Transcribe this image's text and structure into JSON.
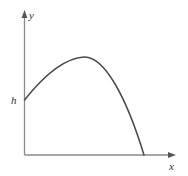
{
  "figure": {
    "background_color": "#ffffff",
    "width": 188,
    "height": 176,
    "axis_color": "#8a8a8a",
    "curve_color": "#4a4a4a",
    "label_color": "#333333",
    "axis_stroke_width": 1.3,
    "curve_stroke_width": 1.5
  },
  "axes": {
    "y_axis": {
      "label": "y",
      "label_x": 29,
      "label_y": 19,
      "x": 24.5,
      "top": 12,
      "bottom": 155,
      "arrow": "up"
    },
    "x_axis": {
      "label": "x",
      "label_x": 169,
      "label_y": 170,
      "y": 155,
      "left": 24.5,
      "right": 175,
      "arrow": "right"
    }
  },
  "markers": {
    "initial_height": {
      "label": "h",
      "label_x": 11,
      "label_y": 104,
      "axis_x": 24.5,
      "axis_y": 100
    }
  },
  "chart_data": {
    "type": "line",
    "title": "",
    "xlabel": "x",
    "ylabel": "y",
    "grid": false,
    "legend": false,
    "xlim": [
      0,
      175
    ],
    "ylim": [
      0,
      155
    ],
    "annotations": [
      {
        "text": "h",
        "meaning": "initial height on y-axis",
        "x": 0,
        "y": 55
      },
      {
        "text": "y",
        "meaning": "vertical axis label"
      },
      {
        "text": "x",
        "meaning": "horizontal axis label"
      }
    ],
    "series": [
      {
        "name": "trajectory",
        "description": "downward-opening parabolic arc launched from height h, peaking then falling to the x-axis",
        "color": "#4a4a4a",
        "points": [
          {
            "x": 24.5,
            "y": 100
          },
          {
            "x": 33,
            "y": 88
          },
          {
            "x": 42,
            "y": 78
          },
          {
            "x": 51,
            "y": 70
          },
          {
            "x": 60,
            "y": 64
          },
          {
            "x": 69,
            "y": 60
          },
          {
            "x": 78,
            "y": 57.5
          },
          {
            "x": 84,
            "y": 57
          },
          {
            "x": 92,
            "y": 58.5
          },
          {
            "x": 100,
            "y": 63
          },
          {
            "x": 108,
            "y": 71
          },
          {
            "x": 116,
            "y": 82
          },
          {
            "x": 124,
            "y": 97
          },
          {
            "x": 132,
            "y": 116
          },
          {
            "x": 138,
            "y": 132
          },
          {
            "x": 144,
            "y": 155
          }
        ],
        "path": "M 24.5 100 C 42 78, 64 58, 84 57 C 104 56, 126 96, 144 155"
      }
    ]
  }
}
